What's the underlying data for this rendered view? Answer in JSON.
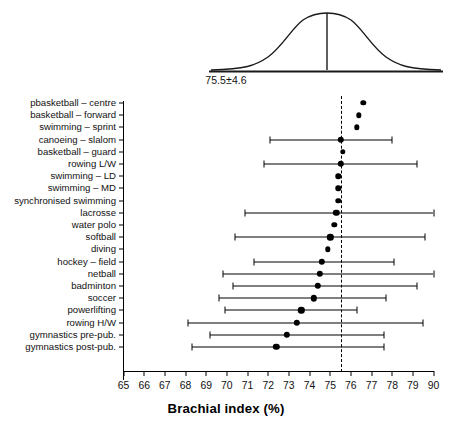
{
  "figure": {
    "xlabel": "Brachial index (%)",
    "distribution_caption": "75.5±4.6"
  },
  "chart_data": {
    "type": "scatter",
    "title": "",
    "subtitle": "",
    "xlabel": "Brachial index (%)",
    "ylabel": "",
    "xlim": [
      65,
      80
    ],
    "ylim": [
      0,
      23
    ],
    "grid": false,
    "legend": null,
    "orientation": "horizontal",
    "error_bar_type": "range",
    "reference_line": {
      "value": 75.5,
      "style": "dashed",
      "label": "75.5±4.6"
    },
    "distribution_overlay": {
      "type": "normal-curve",
      "mean": 75.5,
      "sd": 4.6,
      "annotation": "75.5±4.6"
    },
    "xticks": [
      "65",
      "66",
      "67",
      "68",
      "69",
      "70",
      "71",
      "72",
      "73",
      "74",
      "75",
      "76",
      "77",
      "78",
      "79",
      "90"
    ],
    "xtick_values": [
      65,
      66,
      67,
      68,
      69,
      70,
      71,
      72,
      73,
      74,
      75,
      76,
      77,
      78,
      79,
      80
    ],
    "categories": [
      "pbasketball – centre",
      "basketball – forward",
      "swimming – sprint",
      "canoeing – slalom",
      "basketball – guard",
      "rowing L/W",
      "swimming – LD",
      "swimming – MD",
      "synchronised swimming",
      "lacrosse",
      "water polo",
      "softball",
      "diving",
      "hockey – field",
      "netball",
      "badminton",
      "soccer",
      "powerlifting",
      "rowing H/W",
      "gymnastics pre-pub.",
      "gymnastics post-pub."
    ],
    "values": [
      76.6,
      76.4,
      76.3,
      75.5,
      75.6,
      75.5,
      75.4,
      75.4,
      75.4,
      75.3,
      75.2,
      75.0,
      74.9,
      74.6,
      74.5,
      74.4,
      74.2,
      73.6,
      73.4,
      72.9,
      72.4
    ],
    "errors_low": [
      null,
      null,
      null,
      72.1,
      null,
      71.8,
      null,
      null,
      null,
      70.9,
      null,
      70.4,
      null,
      71.3,
      69.8,
      70.3,
      69.6,
      69.9,
      68.1,
      69.2,
      68.3
    ],
    "errors_high": [
      null,
      null,
      null,
      78.0,
      null,
      79.2,
      null,
      null,
      null,
      80.0,
      null,
      79.6,
      null,
      78.1,
      80.0,
      79.2,
      77.7,
      76.3,
      79.5,
      77.6,
      77.6
    ],
    "points": [
      {
        "label": "pbasketball – centre",
        "value": 76.6,
        "low": null,
        "high": null
      },
      {
        "label": "basketball – forward",
        "value": 76.4,
        "low": null,
        "high": null
      },
      {
        "label": "swimming – sprint",
        "value": 76.3,
        "low": null,
        "high": null
      },
      {
        "label": "canoeing – slalom",
        "value": 75.5,
        "low": 72.1,
        "high": 78.0
      },
      {
        "label": "basketball – guard",
        "value": 75.6,
        "low": null,
        "high": null
      },
      {
        "label": "rowing L/W",
        "value": 75.5,
        "low": 71.8,
        "high": 79.2
      },
      {
        "label": "swimming – LD",
        "value": 75.4,
        "low": null,
        "high": null
      },
      {
        "label": "swimming – MD",
        "value": 75.4,
        "low": null,
        "high": null
      },
      {
        "label": "synchronised swimming",
        "value": 75.4,
        "low": null,
        "high": null
      },
      {
        "label": "lacrosse",
        "value": 75.3,
        "low": 70.9,
        "high": 80.0
      },
      {
        "label": "water polo",
        "value": 75.2,
        "low": null,
        "high": null
      },
      {
        "label": "softball",
        "value": 75.0,
        "low": 70.4,
        "high": 79.6
      },
      {
        "label": "diving",
        "value": 74.9,
        "low": null,
        "high": null
      },
      {
        "label": "hockey – field",
        "value": 74.6,
        "low": 71.3,
        "high": 78.1
      },
      {
        "label": "netball",
        "value": 74.5,
        "low": 69.8,
        "high": 80.0
      },
      {
        "label": "badminton",
        "value": 74.4,
        "low": 70.3,
        "high": 79.2
      },
      {
        "label": "soccer",
        "value": 74.2,
        "low": 69.6,
        "high": 77.7
      },
      {
        "label": "powerlifting",
        "value": 73.6,
        "low": 69.9,
        "high": 76.3
      },
      {
        "label": "rowing H/W",
        "value": 73.4,
        "low": 68.1,
        "high": 79.5
      },
      {
        "label": "gymnastics pre-pub.",
        "value": 72.9,
        "low": 69.2,
        "high": 77.6
      },
      {
        "label": "gymnastics post-pub.",
        "value": 72.4,
        "low": 68.3,
        "high": 77.6
      }
    ]
  }
}
